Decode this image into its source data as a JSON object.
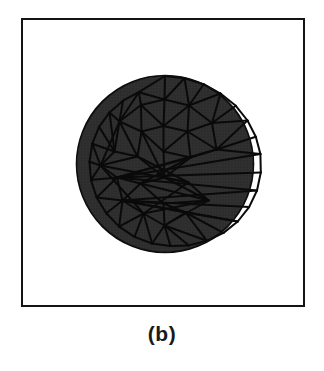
{
  "figure": {
    "caption": "(b)",
    "frame": {
      "border_color": "#141414",
      "background_color": "#ffffff",
      "border_width_px": 2
    }
  },
  "chart_data": {
    "type": "diagram",
    "subtype": "finite-element-triangular-mesh",
    "title": "(b)",
    "subtitle": "",
    "xlabel": "",
    "ylabel": "",
    "grid": false,
    "legend": null,
    "annotations": [],
    "domain_shape": "circle",
    "domain": {
      "center_x": 89.5,
      "center_y": 90.5,
      "radius": 88,
      "fill_color": "#2b2b2b",
      "edge_color": "#0d0d0d",
      "edge_width_px": 1.6,
      "hatch": "crosshatch"
    },
    "counts": {
      "boundary_nodes": 28,
      "interior_nodes": 25,
      "total_nodes": 53,
      "triangles": 78
    },
    "style": {
      "element_edge_color": "#0a0a0a",
      "element_edge_width_px": 2.0,
      "element_fill_color": "#2e2e2e",
      "node_marker": "none"
    },
    "boundary_nodes": [
      [
        89.5,
        2.5
      ],
      [
        109.0,
        4.7
      ],
      [
        128.2,
        10.7
      ],
      [
        145.0,
        20.0
      ],
      [
        160.3,
        32.3
      ],
      [
        172.0,
        47.0
      ],
      [
        180.3,
        63.2
      ],
      [
        184.9,
        80.6
      ],
      [
        185.3,
        99.0
      ],
      [
        181.5,
        117.0
      ],
      [
        173.6,
        133.6
      ],
      [
        162.2,
        148.0
      ],
      [
        148.0,
        159.4
      ],
      [
        131.4,
        167.3
      ],
      [
        113.4,
        171.9
      ],
      [
        95.0,
        172.6
      ],
      [
        76.6,
        170.0
      ],
      [
        59.0,
        163.4
      ],
      [
        43.6,
        153.1
      ],
      [
        30.8,
        139.8
      ],
      [
        21.2,
        124.0
      ],
      [
        15.5,
        106.6
      ],
      [
        14.0,
        88.3
      ],
      [
        16.8,
        70.2
      ],
      [
        23.6,
        53.4
      ],
      [
        34.0,
        38.9
      ],
      [
        47.5,
        27.2
      ],
      [
        63.3,
        18.7
      ]
    ],
    "interior_nodes": [
      [
        89.0,
        26.0
      ],
      [
        65.5,
        31.5
      ],
      [
        113.5,
        32.0
      ],
      [
        44.0,
        48.0
      ],
      [
        136.5,
        49.5
      ],
      [
        88.0,
        52.5
      ],
      [
        66.0,
        58.0
      ],
      [
        112.0,
        58.0
      ],
      [
        39.0,
        78.0
      ],
      [
        141.0,
        76.0
      ],
      [
        88.0,
        78.0
      ],
      [
        62.0,
        83.0
      ],
      [
        115.0,
        84.0
      ],
      [
        41.5,
        104.0
      ],
      [
        139.0,
        102.0
      ],
      [
        89.0,
        104.0
      ],
      [
        65.0,
        110.0
      ],
      [
        113.0,
        109.0
      ],
      [
        47.0,
        127.0
      ],
      [
        133.0,
        127.0
      ],
      [
        88.0,
        130.0
      ],
      [
        68.0,
        140.0
      ],
      [
        110.0,
        139.0
      ],
      [
        89.0,
        152.0
      ],
      [
        25.0,
        92.0
      ]
    ],
    "triangles": [
      [
        0,
        1,
        28
      ],
      [
        0,
        28,
        27
      ],
      [
        1,
        2,
        30
      ],
      [
        1,
        30,
        28
      ],
      [
        2,
        3,
        30
      ],
      [
        3,
        4,
        32
      ],
      [
        3,
        32,
        30
      ],
      [
        4,
        5,
        32
      ],
      [
        5,
        6,
        37
      ],
      [
        5,
        37,
        32
      ],
      [
        6,
        7,
        37
      ],
      [
        7,
        8,
        41
      ],
      [
        7,
        41,
        37
      ],
      [
        8,
        9,
        41
      ],
      [
        9,
        10,
        46
      ],
      [
        9,
        46,
        41
      ],
      [
        10,
        11,
        46
      ],
      [
        11,
        12,
        50
      ],
      [
        11,
        50,
        46
      ],
      [
        12,
        13,
        50
      ],
      [
        13,
        14,
        51
      ],
      [
        13,
        51,
        50
      ],
      [
        14,
        15,
        51
      ],
      [
        15,
        16,
        51
      ],
      [
        16,
        17,
        49
      ],
      [
        16,
        49,
        51
      ],
      [
        17,
        18,
        49
      ],
      [
        18,
        19,
        46
      ],
      [
        18,
        46,
        49
      ],
      [
        19,
        20,
        46
      ],
      [
        20,
        21,
        41
      ],
      [
        20,
        41,
        46
      ],
      [
        21,
        22,
        52
      ],
      [
        22,
        23,
        52
      ],
      [
        23,
        24,
        36
      ],
      [
        24,
        25,
        36
      ],
      [
        25,
        26,
        31
      ],
      [
        25,
        31,
        36
      ],
      [
        26,
        27,
        31
      ],
      [
        27,
        28,
        29
      ],
      [
        27,
        29,
        31
      ],
      [
        28,
        29,
        33
      ],
      [
        28,
        30,
        33
      ],
      [
        29,
        31,
        34
      ],
      [
        29,
        33,
        34
      ],
      [
        30,
        32,
        35
      ],
      [
        30,
        33,
        35
      ],
      [
        31,
        34,
        39
      ],
      [
        31,
        36,
        39
      ],
      [
        32,
        35,
        37
      ],
      [
        33,
        34,
        38
      ],
      [
        33,
        35,
        38
      ],
      [
        34,
        38,
        43
      ],
      [
        34,
        39,
        43
      ],
      [
        35,
        38,
        40
      ],
      [
        35,
        37,
        40
      ],
      [
        36,
        39,
        52
      ],
      [
        37,
        40,
        41
      ],
      [
        38,
        40,
        43
      ],
      [
        39,
        43,
        45
      ],
      [
        39,
        45,
        52
      ],
      [
        40,
        41,
        44
      ],
      [
        40,
        43,
        44
      ],
      [
        41,
        44,
        46
      ],
      [
        43,
        44,
        47
      ],
      [
        43,
        45,
        47
      ],
      [
        44,
        46,
        48
      ],
      [
        44,
        47,
        48
      ],
      [
        45,
        47,
        49
      ],
      [
        45,
        49,
        52
      ],
      [
        46,
        48,
        50
      ],
      [
        47,
        48,
        51
      ],
      [
        47,
        49,
        51
      ],
      [
        48,
        50,
        51
      ],
      [
        21,
        41,
        52
      ],
      [
        36,
        52,
        31
      ],
      [
        29,
        34,
        31
      ],
      [
        38,
        43,
        40
      ]
    ],
    "boundary_polygon_closed": true
  }
}
